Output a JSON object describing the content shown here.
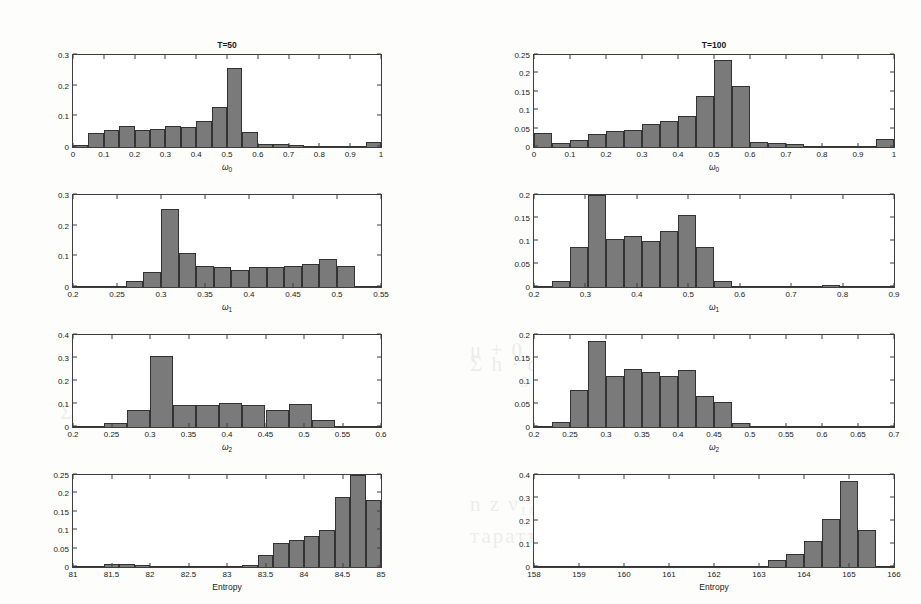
{
  "figure": {
    "background_color": "#fdfdfc",
    "bar_color": "#7a7a7a",
    "axis_color": "#3d3d3d",
    "column_titles": [
      "T=50",
      "T=100"
    ],
    "ghost_text": [
      "1902                  10²°                (b)",
      "Σ h · d",
      "μ + 0.1 Ψ1.0' a 10.0ψγ",
      "s · Σ 0.12·λхс · ω 1.1",
      "Σ kₖₖₖ ∧ σνηταи",
      "n z  ν₁₀ · ρε δε ·  s μα α σ",
      "таратъ нентрорати тте логерате"
    ]
  },
  "chart_data": [
    {
      "id": "w0-T50",
      "type": "bar",
      "title": "T=50",
      "xlabel": "ω₀",
      "ylabel": "",
      "xlim": [
        0,
        1
      ],
      "ylim": [
        0,
        0.3
      ],
      "xticks": [
        0,
        0.1,
        0.2,
        0.3,
        0.4,
        0.5,
        0.6,
        0.7,
        0.8,
        0.9,
        1
      ],
      "xticklabels": [
        "0",
        "0.1",
        "0.2",
        "0.3",
        "0.4",
        "0.5",
        "0.6",
        "0.7",
        "0.8",
        "0.9",
        "1"
      ],
      "yticks": [
        0,
        0.1,
        0.2,
        0.3
      ],
      "yticklabels": [
        "0",
        "0.1",
        "0.2",
        "0.3"
      ],
      "bin_edges": [
        0,
        0.05,
        0.1,
        0.15,
        0.2,
        0.25,
        0.3,
        0.35,
        0.4,
        0.45,
        0.5,
        0.55,
        0.6,
        0.65,
        0.7,
        0.75,
        0.8,
        0.85,
        0.9,
        0.95,
        1.0
      ],
      "values": [
        0.006,
        0.045,
        0.055,
        0.067,
        0.057,
        0.06,
        0.069,
        0.064,
        0.084,
        0.13,
        0.259,
        0.049,
        0.01,
        0.011,
        0.008,
        0.004,
        0.003,
        0.002,
        0.001,
        0.017
      ],
      "grid": false,
      "legend": null
    },
    {
      "id": "w0-T100",
      "type": "bar",
      "title": "T=100",
      "xlabel": "ω₀",
      "ylabel": "",
      "xlim": [
        0,
        1
      ],
      "ylim": [
        0,
        0.25
      ],
      "xticks": [
        0,
        0.1,
        0.2,
        0.3,
        0.4,
        0.5,
        0.6,
        0.7,
        0.8,
        0.9,
        1
      ],
      "xticklabels": [
        "0",
        "0.1",
        "0.2",
        "0.3",
        "0.4",
        "0.5",
        "0.6",
        "0.7",
        "0.8",
        "0.9",
        "1"
      ],
      "yticks": [
        0,
        0.05,
        0.1,
        0.15,
        0.2,
        0.25
      ],
      "yticklabels": [
        "0",
        "0.05",
        "0.1",
        "0.15",
        "0.2",
        "0.25"
      ],
      "bin_edges": [
        0,
        0.05,
        0.1,
        0.15,
        0.2,
        0.25,
        0.3,
        0.35,
        0.4,
        0.45,
        0.5,
        0.55,
        0.6,
        0.65,
        0.7,
        0.75,
        0.8,
        0.85,
        0.9,
        0.95,
        1.0
      ],
      "values": [
        0.037,
        0.011,
        0.02,
        0.035,
        0.043,
        0.045,
        0.062,
        0.071,
        0.083,
        0.138,
        0.236,
        0.167,
        0.014,
        0.01,
        0.007,
        0.003,
        0.002,
        0.001,
        0.001,
        0.022
      ],
      "grid": false,
      "legend": null
    },
    {
      "id": "w1-T50",
      "type": "bar",
      "title": "",
      "xlabel": "ω₁",
      "ylabel": "",
      "xlim": [
        0.2,
        0.55
      ],
      "ylim": [
        0,
        0.3
      ],
      "xticks": [
        0.2,
        0.25,
        0.3,
        0.35,
        0.4,
        0.45,
        0.5,
        0.55
      ],
      "xticklabels": [
        "0.2",
        "0.25",
        "0.3",
        "0.35",
        "0.4",
        "0.45",
        "0.5",
        "0.55"
      ],
      "yticks": [
        0,
        0.1,
        0.2,
        0.3
      ],
      "yticklabels": [
        "0",
        "0.1",
        "0.2",
        "0.3"
      ],
      "bin_edges": [
        0.2,
        0.22,
        0.24,
        0.26,
        0.28,
        0.3,
        0.32,
        0.34,
        0.36,
        0.38,
        0.4,
        0.42,
        0.44,
        0.46,
        0.48,
        0.5,
        0.52,
        0.55
      ],
      "values": [
        0.0,
        0.001,
        0.002,
        0.018,
        0.049,
        0.254,
        0.11,
        0.068,
        0.066,
        0.055,
        0.065,
        0.064,
        0.068,
        0.075,
        0.091,
        0.068,
        0.003
      ],
      "grid": false,
      "legend": null
    },
    {
      "id": "w1-T100",
      "type": "bar",
      "title": "",
      "xlabel": "ω₁",
      "ylabel": "",
      "xlim": [
        0.2,
        0.9
      ],
      "ylim": [
        0,
        0.2
      ],
      "xticks": [
        0.2,
        0.3,
        0.4,
        0.5,
        0.6,
        0.7,
        0.8,
        0.9
      ],
      "xticklabels": [
        "0.2",
        "0.3",
        "0.4",
        "0.5",
        "0.6",
        "0.7",
        "0.8",
        "0.9"
      ],
      "yticks": [
        0,
        0.05,
        0.1,
        0.15,
        0.2
      ],
      "yticklabels": [
        "0",
        "0.05",
        "0.1",
        "0.15",
        "0.2"
      ],
      "bin_edges": [
        0.2,
        0.235,
        0.27,
        0.305,
        0.34,
        0.375,
        0.41,
        0.445,
        0.48,
        0.515,
        0.55,
        0.585,
        0.62,
        0.655,
        0.69,
        0.725,
        0.76,
        0.795,
        0.83,
        0.865,
        0.9
      ],
      "values": [
        0.002,
        0.014,
        0.086,
        0.228,
        0.105,
        0.111,
        0.099,
        0.121,
        0.156,
        0.086,
        0.014,
        0.0,
        0.002,
        0.003,
        0.002,
        0.002,
        0.004,
        0.0,
        0.003,
        0.0
      ],
      "grid": false,
      "legend": null
    },
    {
      "id": "w2-T50",
      "type": "bar",
      "title": "",
      "xlabel": "ω₂",
      "ylabel": "",
      "xlim": [
        0.2,
        0.6
      ],
      "ylim": [
        0,
        0.4
      ],
      "xticks": [
        0.2,
        0.25,
        0.3,
        0.35,
        0.4,
        0.45,
        0.5,
        0.55,
        0.6
      ],
      "xticklabels": [
        "0.2",
        "0.25",
        "0.3",
        "0.35",
        "0.4",
        "0.45",
        "0.5",
        "0.55",
        "0.6"
      ],
      "yticks": [
        0,
        0.1,
        0.2,
        0.3,
        0.4
      ],
      "yticklabels": [
        "0",
        "0.1",
        "0.2",
        "0.3",
        "0.4"
      ],
      "bin_edges": [
        0.2,
        0.22,
        0.24,
        0.27,
        0.3,
        0.33,
        0.36,
        0.39,
        0.42,
        0.45,
        0.48,
        0.51,
        0.54,
        0.57,
        0.6
      ],
      "values": [
        0.0,
        0.001,
        0.018,
        0.074,
        0.309,
        0.097,
        0.096,
        0.106,
        0.094,
        0.076,
        0.101,
        0.03,
        0.006,
        0.004
      ],
      "grid": false,
      "legend": null
    },
    {
      "id": "w2-T100",
      "type": "bar",
      "title": "",
      "xlabel": "ω₂",
      "ylabel": "",
      "xlim": [
        0.2,
        0.7
      ],
      "ylim": [
        0,
        0.2
      ],
      "xticks": [
        0.2,
        0.25,
        0.3,
        0.35,
        0.4,
        0.45,
        0.5,
        0.55,
        0.6,
        0.65,
        0.7
      ],
      "xticklabels": [
        "0.2",
        "0.25",
        "0.3",
        "0.35",
        "0.4",
        "0.45",
        "0.5",
        "0.55",
        "0.6",
        "0.65",
        "0.7"
      ],
      "yticks": [
        0,
        0.05,
        0.1,
        0.15,
        0.2
      ],
      "yticklabels": [
        "0",
        "0.05",
        "0.1",
        "0.15",
        "0.2"
      ],
      "bin_edges": [
        0.2,
        0.225,
        0.25,
        0.275,
        0.3,
        0.325,
        0.35,
        0.375,
        0.4,
        0.425,
        0.45,
        0.475,
        0.5,
        0.525,
        0.55,
        0.575,
        0.6,
        0.625,
        0.65,
        0.675,
        0.7
      ],
      "values": [
        0.003,
        0.01,
        0.081,
        0.187,
        0.111,
        0.127,
        0.12,
        0.11,
        0.124,
        0.067,
        0.054,
        0.008,
        0.003,
        0.002,
        0.002,
        0.001,
        0.001,
        0.001,
        0.0,
        0.0
      ],
      "grid": false,
      "legend": null
    },
    {
      "id": "entropy-T50",
      "type": "bar",
      "title": "",
      "xlabel": "Entropy",
      "ylabel": "",
      "xlim": [
        81,
        85
      ],
      "ylim": [
        0,
        0.25
      ],
      "xticks": [
        81,
        81.5,
        82,
        82.5,
        83,
        83.5,
        84,
        84.5,
        85
      ],
      "xticklabels": [
        "81",
        "81.5",
        "82",
        "82.5",
        "83",
        "83.5",
        "84",
        "84.5",
        "85"
      ],
      "yticks": [
        0,
        0.05,
        0.1,
        0.15,
        0.2,
        0.25
      ],
      "yticklabels": [
        "0",
        "0.05",
        "0.1",
        "0.15",
        "0.2",
        "0.25"
      ],
      "bin_edges": [
        81,
        81.2,
        81.4,
        81.6,
        81.8,
        82.0,
        82.2,
        82.4,
        82.6,
        82.8,
        83.0,
        83.2,
        83.4,
        83.6,
        83.8,
        84.0,
        84.2,
        84.4,
        84.6,
        84.8,
        85.0
      ],
      "values": [
        0.0,
        0.004,
        0.007,
        0.008,
        0.006,
        0.003,
        0.001,
        0.001,
        0.001,
        0.003,
        0.004,
        0.005,
        0.034,
        0.064,
        0.074,
        0.085,
        0.1,
        0.189,
        0.277,
        0.181
      ],
      "clipped_bars": [
        18
      ],
      "grid": false,
      "legend": null
    },
    {
      "id": "entropy-T100",
      "type": "bar",
      "title": "",
      "xlabel": "Entropy",
      "ylabel": "",
      "xlim": [
        158,
        166
      ],
      "ylim": [
        0,
        0.4
      ],
      "xticks": [
        158,
        159,
        160,
        161,
        162,
        163,
        164,
        165,
        166
      ],
      "xticklabels": [
        "158",
        "159",
        "160",
        "161",
        "162",
        "163",
        "164",
        "165",
        "166"
      ],
      "yticks": [
        0,
        0.1,
        0.2,
        0.3,
        0.4
      ],
      "yticklabels": [
        "0",
        "0.1",
        "0.2",
        "0.3",
        "0.4"
      ],
      "bin_edges": [
        158,
        158.4,
        158.8,
        159.2,
        159.6,
        160.0,
        160.4,
        160.8,
        161.2,
        161.6,
        162.0,
        162.4,
        162.8,
        163.2,
        163.6,
        164.0,
        164.4,
        164.8,
        165.2,
        165.6,
        166.0
      ],
      "values": [
        0.0,
        0.001,
        0.003,
        0.002,
        0.003,
        0.004,
        0.003,
        0.003,
        0.004,
        0.004,
        0.004,
        0.004,
        0.005,
        0.03,
        0.057,
        0.113,
        0.21,
        0.375,
        0.162,
        0.0
      ],
      "grid": false,
      "legend": null
    }
  ]
}
